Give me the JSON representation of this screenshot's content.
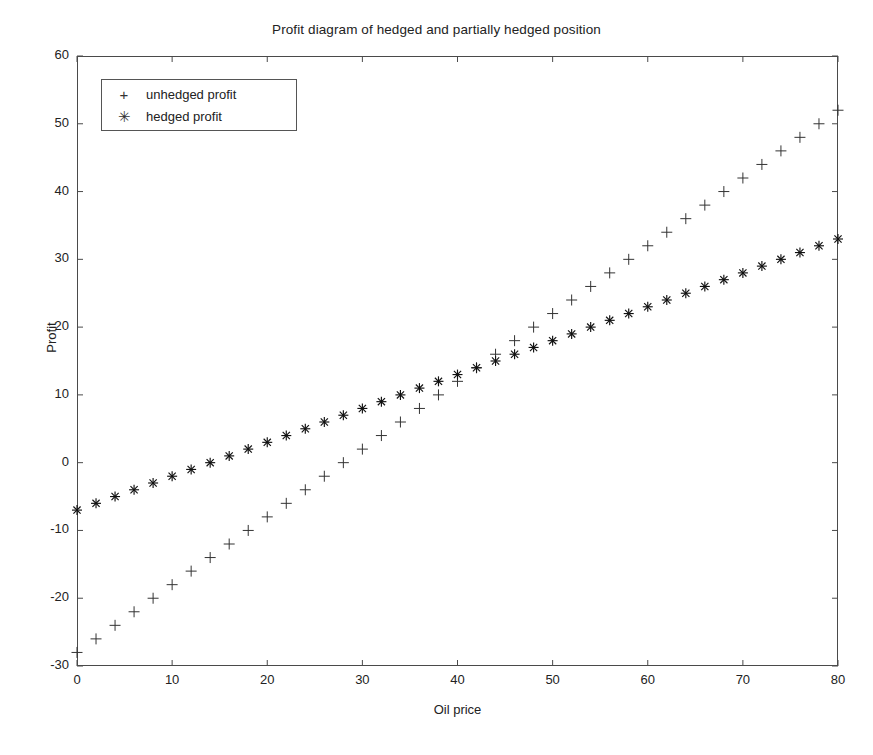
{
  "chart_data": {
    "type": "scatter",
    "title": "Profit diagram of hedged and partially hedged position",
    "xlabel": "Oil price",
    "ylabel": "Profit",
    "xlim": [
      0,
      80
    ],
    "ylim": [
      -30,
      60
    ],
    "xticks": [
      0,
      10,
      20,
      30,
      40,
      50,
      60,
      70,
      80
    ],
    "yticks": [
      -30,
      -20,
      -10,
      0,
      10,
      20,
      30,
      40,
      50,
      60
    ],
    "grid": false,
    "legend_position": "upper left",
    "x": [
      0,
      2,
      4,
      6,
      8,
      10,
      12,
      14,
      16,
      18,
      20,
      22,
      24,
      26,
      28,
      30,
      32,
      34,
      36,
      38,
      40,
      42,
      44,
      46,
      48,
      50,
      52,
      54,
      56,
      58,
      60,
      62,
      64,
      66,
      68,
      70,
      72,
      74,
      76,
      78,
      80
    ],
    "series": [
      {
        "name": "unhedged profit",
        "marker": "+",
        "color": "#333333",
        "values": [
          -28,
          -26,
          -24,
          -22,
          -20,
          -18,
          -16,
          -14,
          -12,
          -10,
          -8,
          -6,
          -4,
          -2,
          0,
          2,
          4,
          6,
          8,
          10,
          12,
          14,
          16,
          18,
          20,
          22,
          24,
          26,
          28,
          30,
          32,
          34,
          36,
          38,
          40,
          42,
          44,
          46,
          48,
          50,
          52
        ]
      },
      {
        "name": "hedged profit",
        "marker": "*",
        "color": "#111111",
        "values": [
          -7,
          -6,
          -5,
          -4,
          -3,
          -2,
          -1,
          0,
          1,
          2,
          3,
          4,
          5,
          6,
          7,
          8,
          9,
          10,
          11,
          12,
          13,
          14,
          15,
          16,
          17,
          18,
          19,
          20,
          21,
          22,
          23,
          24,
          25,
          26,
          27,
          28,
          29,
          30,
          31,
          32,
          33
        ]
      }
    ]
  },
  "legend": {
    "items": [
      {
        "marker": "+",
        "label": "unhedged profit"
      },
      {
        "marker": "✳",
        "label": "hedged profit"
      }
    ]
  },
  "axis": {
    "x_tick_labels": [
      "0",
      "10",
      "20",
      "30",
      "40",
      "50",
      "60",
      "70",
      "80"
    ],
    "y_tick_labels": [
      "60",
      "50",
      "40",
      "30",
      "20",
      "10",
      "0",
      "-10",
      "-20",
      "-30"
    ]
  },
  "colors": {
    "background": "#ffffff",
    "axis": "#4a4a4a",
    "unhedged": "#333333",
    "hedged": "#111111"
  }
}
